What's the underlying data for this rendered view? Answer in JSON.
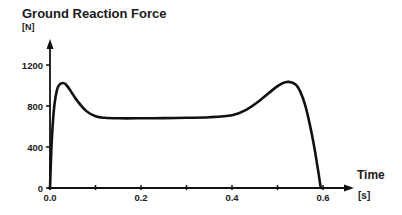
{
  "chart_data": {
    "type": "line",
    "title": "Ground Reaction Force",
    "ylabel": "[N]",
    "xlabel": "Time",
    "xunit": "[s]",
    "xlim": [
      0.0,
      0.6
    ],
    "ylim": [
      0,
      1200
    ],
    "x_ticks": [
      0.0,
      0.1,
      0.2,
      0.3,
      0.4,
      0.5,
      0.6
    ],
    "x_tick_labels": [
      "0.0",
      "",
      "0.2",
      "",
      "0.4",
      "",
      "0.6"
    ],
    "y_ticks": [
      0,
      400,
      800,
      1200
    ],
    "y_tick_labels": [
      "0",
      "400",
      "800",
      "1200"
    ],
    "grid": false,
    "legend": null,
    "series": [
      {
        "name": "Ground Reaction Force",
        "color": "#111111",
        "x": [
          0.0,
          0.003,
          0.006,
          0.01,
          0.015,
          0.02,
          0.028,
          0.035,
          0.045,
          0.06,
          0.08,
          0.1,
          0.12,
          0.15,
          0.2,
          0.25,
          0.3,
          0.35,
          0.4,
          0.43,
          0.46,
          0.49,
          0.51,
          0.525,
          0.54,
          0.55,
          0.56,
          0.57,
          0.58,
          0.59,
          0.595
        ],
        "values": [
          0,
          380,
          620,
          820,
          950,
          1005,
          1025,
          1010,
          950,
          850,
          750,
          700,
          685,
          680,
          680,
          682,
          685,
          690,
          710,
          760,
          850,
          960,
          1020,
          1035,
          1010,
          940,
          820,
          640,
          420,
          150,
          0
        ]
      }
    ],
    "annotations": []
  },
  "layout": {
    "x0_px": 50,
    "x_scale_px_per_s": 455,
    "y0_px": 188,
    "y_scale_px_per_N": 0.1025
  }
}
